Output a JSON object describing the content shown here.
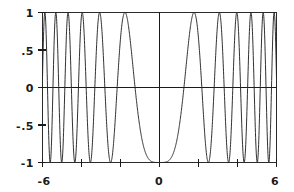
{
  "chart_data": {
    "type": "line",
    "title": "",
    "subtitle": "",
    "xlabel": "",
    "ylabel": "",
    "function": "y = -cos(x^2)",
    "xlim": [
      -6,
      6
    ],
    "ylim": [
      -1,
      1
    ],
    "grid": false,
    "legend": null,
    "legend_position": "none",
    "x_ticks": [
      -6,
      -4,
      -2,
      0,
      2,
      4,
      6
    ],
    "x_tick_labels": [
      "-6",
      "",
      "",
      "0",
      "",
      "",
      "6"
    ],
    "y_ticks": [
      -1,
      -0.5,
      0,
      0.5,
      1
    ],
    "y_tick_labels": [
      "-1",
      "-.5",
      "0",
      ".5",
      "1"
    ],
    "x_axis_crossing": 0,
    "y_axis_crossing": 0,
    "sample_count": 1400,
    "x": [
      -6,
      -5.5,
      -5,
      -4.5,
      -4,
      -3.5,
      -3,
      -2.5,
      -2,
      -1.5,
      -1.25,
      -1,
      -0.75,
      -0.5,
      -0.25,
      0,
      0.25,
      0.5,
      0.75,
      1,
      1.25,
      1.5,
      2,
      2.5,
      3,
      3.5,
      4,
      4.5,
      5,
      5.5,
      6
    ],
    "y": [
      -0.128,
      -0.739,
      0.991,
      -0.158,
      -0.958,
      0.64,
      0.911,
      -0.997,
      0.654,
      -0.628,
      -1.0,
      -0.54,
      0.842,
      0.969,
      0.998,
      1.0,
      0.998,
      0.969,
      0.842,
      -0.54,
      -1.0,
      -0.628,
      0.654,
      -0.997,
      0.911,
      0.64,
      -0.958,
      -0.158,
      0.991,
      -0.739,
      -0.128
    ],
    "series": [
      {
        "name": "-cos(x^2)",
        "color": "#262626",
        "style": "solid",
        "width": 1
      }
    ]
  },
  "labels": {
    "y": {
      "top": "1",
      "upper_mid": ".5",
      "zero": "0",
      "lower_mid": "-.5",
      "bottom": "-1"
    },
    "x": {
      "left": "-6",
      "zero": "0",
      "right": "6"
    }
  },
  "style": {
    "background": "#ffffff",
    "axis_color": "#1a1a1a",
    "frame_color": "#2b2b2b",
    "curve_color": "#262626"
  }
}
